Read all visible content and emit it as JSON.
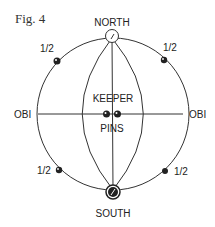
{
  "figure": {
    "title": "Fig. 4"
  },
  "labels": {
    "north": "NORTH",
    "south": "SOUTH",
    "keeper": "KEEPER",
    "pins": "PINS",
    "obi_left": "OBI",
    "obi_right": "OBI",
    "half_top_left": "1/2",
    "half_top_right": "1/2",
    "half_bottom_left": "1/2",
    "half_bottom_right": "1/2"
  },
  "colors": {
    "line": "#333333",
    "background": "#ffffff"
  }
}
